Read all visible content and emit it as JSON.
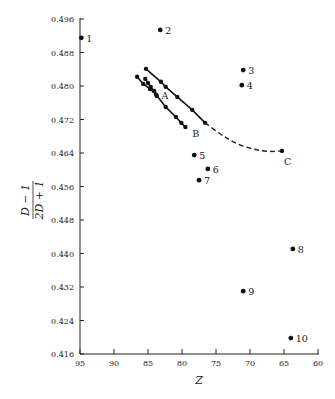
{
  "chart_data": {
    "type": "scatter",
    "title": "",
    "xlabel": "Z",
    "ylabel": "(D − 1)/(2D + 1)",
    "ylabel_numerator": "D − 1",
    "ylabel_denominator": "2D + 1",
    "xlim": [
      95,
      60
    ],
    "ylim": [
      0.416,
      0.496
    ],
    "x_reversed": true,
    "grid": false,
    "legend": "none",
    "x_ticks": [
      95,
      90,
      85,
      80,
      75,
      70,
      65,
      60
    ],
    "x_tick_labels": [
      "95",
      "90",
      "85",
      "80",
      "75",
      "70",
      "65",
      "60"
    ],
    "y_ticks": [
      0.416,
      0.424,
      0.432,
      0.44,
      0.448,
      0.456,
      0.464,
      0.472,
      0.48,
      0.488,
      0.496
    ],
    "y_tick_labels": [
      "0.416",
      "0.424",
      "0.432",
      "0.440",
      "0.448",
      "0.456",
      "0.464",
      "0.472",
      "0.480",
      "0.488",
      "0.496"
    ],
    "points": [
      {
        "label": "1",
        "x": 94.8,
        "y": 0.4915
      },
      {
        "label": "2",
        "x": 83.2,
        "y": 0.4934
      },
      {
        "label": "3",
        "x": 71.0,
        "y": 0.4838
      },
      {
        "label": "4",
        "x": 71.2,
        "y": 0.4802
      },
      {
        "label": "5",
        "x": 78.2,
        "y": 0.4635
      },
      {
        "label": "6",
        "x": 76.2,
        "y": 0.4602
      },
      {
        "label": "7",
        "x": 77.5,
        "y": 0.4575
      },
      {
        "label": "8",
        "x": 63.7,
        "y": 0.4411
      },
      {
        "label": "9",
        "x": 71.0,
        "y": 0.431
      },
      {
        "label": "10",
        "x": 64.0,
        "y": 0.4198
      }
    ],
    "series": [
      {
        "name": "A",
        "style": "solid",
        "x": [
          85.4,
          85.0,
          84.6,
          84.1,
          83.7
        ],
        "y": [
          0.4817,
          0.4807,
          0.4798,
          0.4788,
          0.4776
        ]
      },
      {
        "name": "B",
        "style": "solid",
        "x": [
          86.6,
          85.7,
          84.7,
          83.8,
          82.4,
          80.9,
          80.1,
          79.5
        ],
        "y": [
          0.4822,
          0.4805,
          0.4793,
          0.4779,
          0.475,
          0.4726,
          0.4712,
          0.4702
        ]
      },
      {
        "name": "upper",
        "style": "solid",
        "x": [
          85.3,
          83.1,
          82.4,
          80.7,
          78.5,
          76.6
        ],
        "y": [
          0.4841,
          0.481,
          0.4798,
          0.4774,
          0.4743,
          0.4712
        ]
      },
      {
        "name": "C",
        "style": "dashed",
        "x": [
          76.6,
          74.2,
          72.0,
          69.6,
          67.4,
          65.3
        ],
        "y": [
          0.4712,
          0.4683,
          0.4662,
          0.4649,
          0.4643,
          0.4645
        ]
      }
    ],
    "annotations": [
      {
        "text": "A",
        "x": 83.0,
        "y": 0.4779
      },
      {
        "text": "B",
        "x": 78.5,
        "y": 0.4688
      },
      {
        "text": "C",
        "x": 65.0,
        "y": 0.4622
      }
    ]
  }
}
